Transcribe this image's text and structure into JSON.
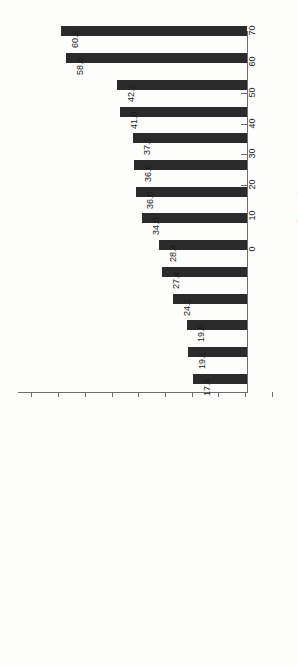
{
  "chart_data": {
    "type": "bar",
    "orientation": "vertical-rotated",
    "title": "",
    "subtitle": "",
    "xlabel": "",
    "ylabel": "Percentage",
    "ylim": [
      0,
      70
    ],
    "tick_labels": [
      "0",
      "10",
      "20",
      "30",
      "40",
      "50",
      "60",
      "70"
    ],
    "ticks": [
      0,
      10,
      20,
      30,
      40,
      50,
      60,
      70
    ],
    "grid": false,
    "legend": null,
    "bar_color": "#2b2b2b",
    "axis_color": "#6e6e6e",
    "background_color": "#fdfdfb",
    "categories": [
      "Aim to achieve best practice",
      "Cost discipline/control",
      "Improve service quality",
      "Focus on core competences",
      "Access to new technology/skills",
      "Reduce headcount",
      "Enhance capability to develop new products/services",
      "Reduce capital cost",
      "Grow in-house expertise",
      "Reduce transaction costs",
      "Reduce production costs",
      "Enhance capability for change",
      "Investment in technology",
      "Enhance position in value chain"
    ],
    "values": [
      60.2,
      58.6,
      42.1,
      41.0,
      37.1,
      36.6,
      36.0,
      34.0,
      28.4,
      27.4,
      24.1,
      19.5,
      19.1,
      17.4
    ],
    "value_labels": [
      "60.2",
      "58.6",
      "42.1",
      "41.0",
      "37.1",
      "36.6",
      "36.0",
      "34.0",
      "28.4",
      "27.4",
      "24.1",
      "19.5",
      "19.1",
      "17.4"
    ]
  }
}
